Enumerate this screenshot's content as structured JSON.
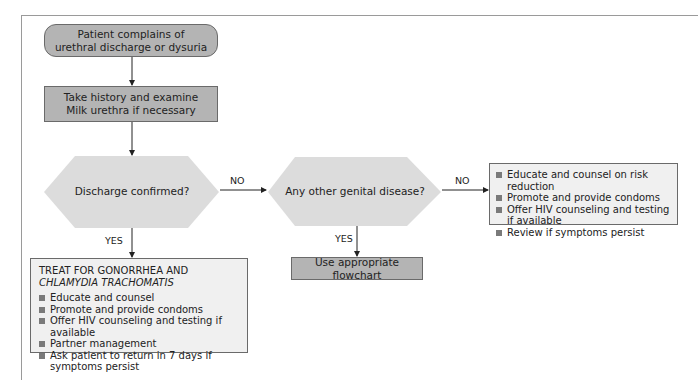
{
  "flowchart": {
    "start": {
      "line1": "Patient complains of",
      "line2": "urethral discharge or dysuria"
    },
    "step1": {
      "line1": "Take history and examine",
      "line2": "Milk urethra if necessary"
    },
    "decision1": {
      "label": "Discharge confirmed?",
      "no_label": "NO",
      "yes_label": "YES"
    },
    "decision2": {
      "label": "Any other genital disease?",
      "no_label": "NO",
      "yes_label": "YES"
    },
    "treat_box": {
      "heading_plain": "TREAT FOR GONORRHEA AND ",
      "heading_italic": "CHLAMYDIA TRACHOMATIS",
      "items": [
        "Educate and counsel",
        "Promote and provide condoms",
        "Offer HIV counseling and testing if available",
        "Partner management",
        "Ask patient to return in 7 days if symptoms persist"
      ]
    },
    "other_flowchart": {
      "label": "Use appropriate flowchart"
    },
    "no_disease_box": {
      "items": [
        "Educate and counsel on risk reduction",
        "Promote and provide condoms",
        "Offer HIV counseling and testing if available",
        "Review if symptoms persist"
      ]
    },
    "colors": {
      "box_fill": "#b4b4b4",
      "decision_fill": "#dcdcdc",
      "list_fill": "#f0f0f0",
      "border": "#6a6a6a"
    }
  }
}
